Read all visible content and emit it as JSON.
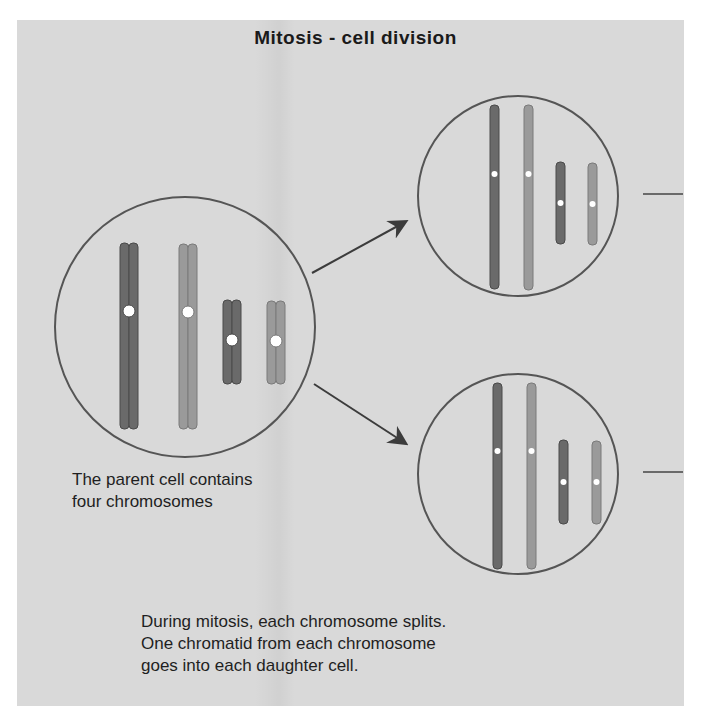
{
  "title": "Mitosis - cell division",
  "captions": {
    "parent_cell": [
      "The parent cell contains",
      "four chromosomes"
    ],
    "mitosis": [
      "During mitosis, each chromosome splits.",
      "One chromatid from each chromosome",
      "goes into each daughter cell."
    ]
  },
  "colors": {
    "background": "#d9d9d9",
    "outline": "#555555",
    "dark_chromosome": "#6a6a6a",
    "light_chromosome": "#9a9a9a",
    "centromere": "#ffffff",
    "arrow": "#3c3c3c"
  },
  "cells": {
    "parent": {
      "label": "parent cell",
      "chromosome_count": 4
    },
    "daughter_top": {
      "label": "daughter cell 1",
      "chromatid_count": 4
    },
    "daughter_bottom": {
      "label": "daughter cell 2",
      "chromatid_count": 4
    }
  }
}
